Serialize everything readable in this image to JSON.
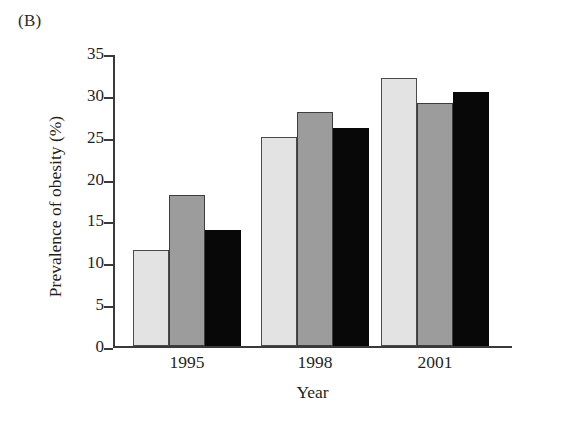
{
  "figure": {
    "panel_letter": "(B)"
  },
  "chart_data": {
    "type": "bar",
    "title": "",
    "xlabel": "Year",
    "ylabel": "Prevalence of obesity (%)",
    "categories": [
      "1995",
      "1998",
      "2001"
    ],
    "ylim": [
      0,
      35
    ],
    "ytick_labels": [
      "0",
      "5",
      "10",
      "15",
      "20",
      "25",
      "30",
      "35"
    ],
    "ytick_values": [
      0,
      5,
      10,
      15,
      20,
      25,
      30,
      35
    ],
    "grid": false,
    "legend": "none",
    "series": [
      {
        "name": "series-1",
        "color": "#e3e3e3",
        "values": [
          11.5,
          25.0,
          32.0
        ]
      },
      {
        "name": "series-2",
        "color": "#9c9c9c",
        "values": [
          18.0,
          28.0,
          29.0
        ]
      },
      {
        "name": "series-3",
        "color": "#080808",
        "values": [
          13.9,
          26.1,
          30.3
        ]
      }
    ]
  }
}
